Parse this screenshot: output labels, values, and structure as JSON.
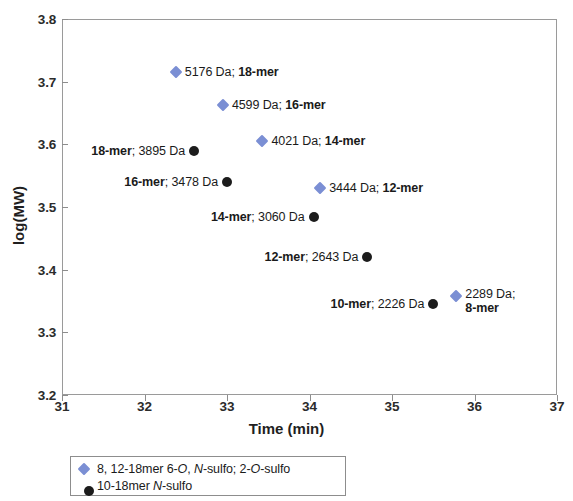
{
  "chart_data": {
    "type": "scatter",
    "title": "",
    "xlabel": "Time (min)",
    "ylabel": "log(MW)",
    "xlim": [
      31,
      37
    ],
    "ylim": [
      3.2,
      3.8
    ],
    "xticks": [
      "31",
      "32",
      "33",
      "34",
      "35",
      "36",
      "37"
    ],
    "yticks": [
      "3.8",
      "3.7",
      "3.6",
      "3.5",
      "3.4",
      "3.3",
      "3.2"
    ],
    "grid": false,
    "legend_position": "below-plot",
    "series": [
      {
        "name": "8, 12-18mer 6-O, N-sulfo; 2-O-sulfo",
        "marker": "diamond",
        "color": "#7b8fd4",
        "points": [
          {
            "x": 32.38,
            "y": 3.715,
            "mass": "5176 Da",
            "mer": "18-mer",
            "label": "5176 Da; 18-mer",
            "label_side": "right"
          },
          {
            "x": 32.95,
            "y": 3.663,
            "mass": "4599 Da",
            "mer": "16-mer",
            "label": "4599 Da; 16-mer",
            "label_side": "right"
          },
          {
            "x": 33.43,
            "y": 3.606,
            "mass": "4021 Da",
            "mer": "14-mer",
            "label": "4021 Da; 14-mer",
            "label_side": "right"
          },
          {
            "x": 34.13,
            "y": 3.531,
            "mass": "3444 Da",
            "mer": "12-mer",
            "label": "3444 Da; 12-mer",
            "label_side": "right"
          },
          {
            "x": 35.78,
            "y": 3.358,
            "mass": "2289 Da",
            "mer": "8-mer",
            "label": "2289 Da; 8-mer",
            "label_side": "right",
            "label_line1": "2289 Da;",
            "label_line2": "8-mer"
          }
        ]
      },
      {
        "name": "10-18mer N-sulfo",
        "marker": "circle",
        "color": "#1c1c1c",
        "points": [
          {
            "x": 32.6,
            "y": 3.59,
            "mass": "3895 Da",
            "mer": "18-mer",
            "label": "18-mer; 3895 Da",
            "label_side": "left"
          },
          {
            "x": 33.0,
            "y": 3.54,
            "mass": "3478 Da",
            "mer": "16-mer",
            "label": "16-mer; 3478 Da",
            "label_side": "left"
          },
          {
            "x": 34.05,
            "y": 3.484,
            "mass": "3060 Da",
            "mer": "14-mer",
            "label": "14-mer; 3060 Da",
            "label_side": "left"
          },
          {
            "x": 34.7,
            "y": 3.42,
            "mass": "2643 Da",
            "mer": "12-mer",
            "label": "12-mer; 2643 Da",
            "label_side": "left"
          },
          {
            "x": 35.5,
            "y": 3.346,
            "mass": "2226 Da",
            "mer": "10-mer",
            "label": "10-mer; 2226 Da",
            "label_side": "left"
          }
        ]
      }
    ]
  },
  "legend": {
    "entries": [
      {
        "marker": "diamond",
        "color": "#7b8fd4",
        "text": "8, 12-18mer 6-O, N-sulfo; 2-O-sulfo"
      },
      {
        "marker": "circle",
        "color": "#1c1c1c",
        "text": "10-18mer N-sulfo"
      }
    ]
  }
}
